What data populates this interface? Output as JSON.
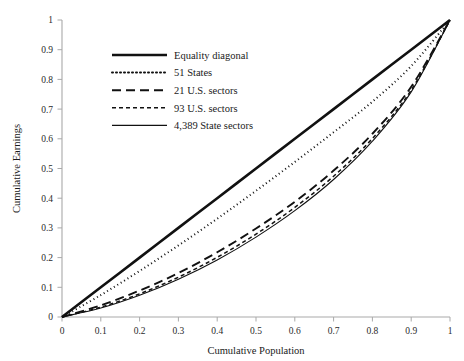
{
  "chart_data": {
    "type": "line",
    "title": "",
    "xlabel": "Cumulative Population",
    "ylabel": "Cumulative Earnings",
    "xlim": [
      0,
      1
    ],
    "ylim": [
      0,
      1
    ],
    "grid": false,
    "legend_position": "upper-left-inside",
    "xticks": [
      "0",
      "0.1",
      "0.2",
      "0.3",
      "0.4",
      "0.5",
      "0.6",
      "0.7",
      "0.8",
      "0.9",
      "1"
    ],
    "yticks": [
      "0",
      "0.1",
      "0.2",
      "0.3",
      "0.4",
      "0.5",
      "0.6",
      "0.7",
      "0.8",
      "0.9",
      "1"
    ],
    "xtick_values": [
      0,
      0.1,
      0.2,
      0.3,
      0.4,
      0.5,
      0.6,
      0.7,
      0.8,
      0.9,
      1
    ],
    "ytick_values": [
      0,
      0.1,
      0.2,
      0.3,
      0.4,
      0.5,
      0.6,
      0.7,
      0.8,
      0.9,
      1
    ],
    "x": [
      0,
      0.1,
      0.2,
      0.3,
      0.4,
      0.5,
      0.6,
      0.7,
      0.8,
      0.9,
      1
    ],
    "series": [
      {
        "name": "Equality diagonal",
        "style": "solid-thick",
        "color": "#111111",
        "width": 2.6,
        "dash": "none",
        "values": [
          0,
          0.1,
          0.2,
          0.3,
          0.4,
          0.5,
          0.6,
          0.7,
          0.8,
          0.9,
          1
        ]
      },
      {
        "name": "51 States",
        "style": "dotted",
        "color": "#111111",
        "width": 2.0,
        "dash": "1,3",
        "values": [
          0,
          0.074,
          0.155,
          0.241,
          0.331,
          0.425,
          0.522,
          0.622,
          0.725,
          0.845,
          1
        ]
      },
      {
        "name": "21 U.S. sectors",
        "style": "long-dash",
        "color": "#111111",
        "width": 1.9,
        "dash": "9,5",
        "values": [
          0,
          0.039,
          0.089,
          0.148,
          0.218,
          0.298,
          0.388,
          0.493,
          0.617,
          0.775,
          1
        ]
      },
      {
        "name": "93 U.S. sectors",
        "style": "short-dash",
        "color": "#111111",
        "width": 1.5,
        "dash": "4,3",
        "values": [
          0,
          0.033,
          0.078,
          0.134,
          0.201,
          0.279,
          0.369,
          0.474,
          0.601,
          0.764,
          1
        ]
      },
      {
        "name": "4,389 State sectors",
        "style": "solid-thin",
        "color": "#111111",
        "width": 1.1,
        "dash": "none",
        "values": [
          0,
          0.03,
          0.073,
          0.127,
          0.192,
          0.269,
          0.358,
          0.463,
          0.592,
          0.758,
          1
        ]
      }
    ]
  },
  "legend": {
    "items": [
      {
        "label": "Equality diagonal"
      },
      {
        "label": "51 States"
      },
      {
        "label": "21 U.S. sectors"
      },
      {
        "label": "93 U.S. sectors"
      },
      {
        "label": "4,389 State sectors"
      }
    ]
  }
}
